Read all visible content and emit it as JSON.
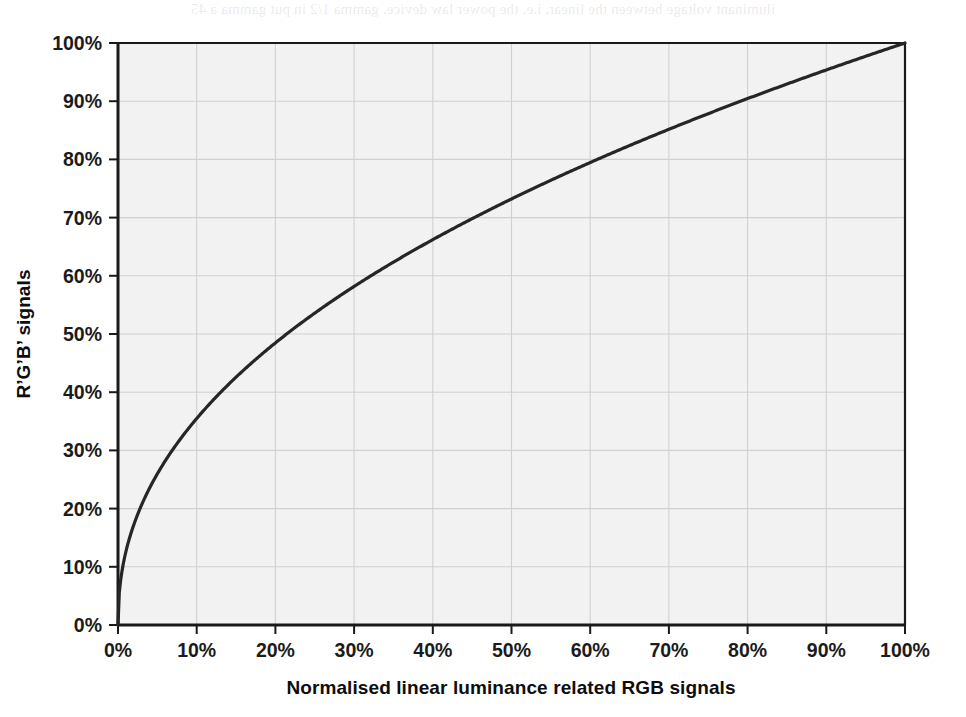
{
  "figure": {
    "background_color": "#ffffff",
    "plot_background_color": "#f2f2f2",
    "grid_color": "#d0d0d0",
    "axis_color": "#1a1a1a",
    "curve_color": "#262626",
    "scan_bleed_text": "iluminant voltage between the linear, i.e. the power law device, gamma 1/2 in put gamma a 45"
  },
  "chart_data": {
    "type": "line",
    "title": "",
    "subtitle": "",
    "xlabel": "Normalised linear luminance related RGB signals",
    "ylabel": "R’G’B’ signals",
    "xlim": [
      0,
      100
    ],
    "ylim": [
      0,
      100
    ],
    "grid": true,
    "legend": false,
    "legend_position": "none",
    "x_tick_labels": [
      "0%",
      "10%",
      "20%",
      "30%",
      "40%",
      "50%",
      "60%",
      "70%",
      "80%",
      "90%",
      "100%"
    ],
    "y_tick_labels": [
      "0%",
      "10%",
      "20%",
      "30%",
      "40%",
      "50%",
      "60%",
      "70%",
      "80%",
      "90%",
      "100%"
    ],
    "x_ticks": [
      0,
      10,
      20,
      30,
      40,
      50,
      60,
      70,
      80,
      90,
      100
    ],
    "y_ticks": [
      0,
      10,
      20,
      30,
      40,
      50,
      60,
      70,
      80,
      90,
      100
    ],
    "series": [
      {
        "name": "Gamma transfer characteristic (y = x^0.45)",
        "exponent": 0.45,
        "color": "#262626",
        "line_width": 3.2,
        "x": [
          0,
          0.5,
          1,
          1.5,
          2,
          2.5,
          3,
          4,
          5,
          6,
          7,
          8,
          9,
          10,
          12,
          14,
          16,
          18,
          20,
          25,
          30,
          35,
          40,
          45,
          50,
          55,
          60,
          65,
          70,
          75,
          80,
          85,
          90,
          95,
          100
        ],
        "y": [
          0,
          9.0,
          12.3,
          14.7,
          16.8,
          18.6,
          20.2,
          23.0,
          25.4,
          27.5,
          29.4,
          31.2,
          32.9,
          34.5,
          37.4,
          40.0,
          42.4,
          44.6,
          46.7,
          51.4,
          55.6,
          59.4,
          62.9,
          66.1,
          69.2,
          72.1,
          74.8,
          77.4,
          79.9,
          82.4,
          84.7,
          87.0,
          89.2,
          91.3,
          100.0
        ]
      }
    ],
    "annotations": []
  }
}
